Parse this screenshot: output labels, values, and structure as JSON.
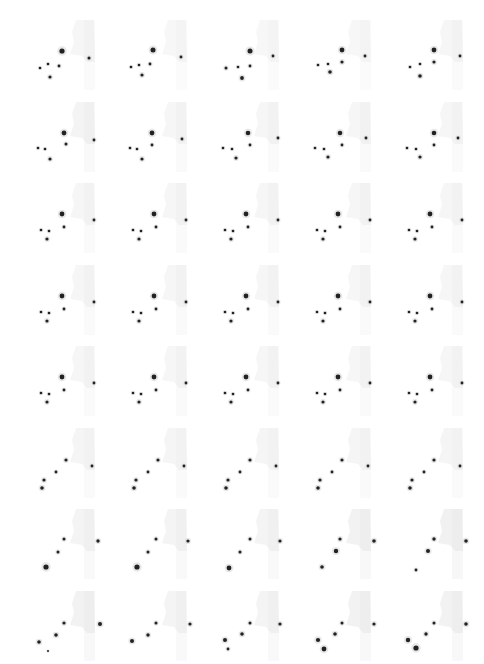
{
  "figure": {
    "layout": {
      "columns": 5,
      "rows": 8,
      "frame_count": 40
    },
    "background_color": "#ffffff",
    "tissue_color": "#e6e6e6",
    "cell_color": "#222222",
    "frames": [
      {
        "tissue": 0.35,
        "cells": [
          [
            48,
            37,
            2.6
          ],
          [
            75,
            44,
            1.5
          ],
          [
            34,
            50,
            1.3
          ],
          [
            45,
            52,
            1.4
          ],
          [
            26,
            54,
            1.3
          ],
          [
            36,
            63,
            1.6
          ]
        ]
      },
      {
        "tissue": 0.3,
        "cells": [
          [
            47,
            36,
            2.5
          ],
          [
            75,
            43,
            1.4
          ],
          [
            33,
            51,
            1.3
          ],
          [
            44,
            50,
            1.4
          ],
          [
            25,
            53,
            1.3
          ],
          [
            36,
            61,
            1.6
          ]
        ]
      },
      {
        "tissue": 0.3,
        "cells": [
          [
            52,
            37,
            2.5
          ],
          [
            75,
            42,
            1.4
          ],
          [
            40,
            53,
            1.3
          ],
          [
            52,
            52,
            1.4
          ],
          [
            28,
            54,
            1.5
          ],
          [
            44,
            64,
            1.9
          ]
        ]
      },
      {
        "tissue": 0.3,
        "cells": [
          [
            52,
            36,
            2.4
          ],
          [
            75,
            42,
            1.4
          ],
          [
            38,
            50,
            1.3
          ],
          [
            52,
            48,
            1.6
          ],
          [
            28,
            51,
            1.3
          ],
          [
            40,
            58,
            1.8
          ]
        ]
      },
      {
        "tissue": 0.35,
        "cells": [
          [
            52,
            36,
            2.4
          ],
          [
            78,
            42,
            1.4
          ],
          [
            38,
            50,
            1.3
          ],
          [
            52,
            48,
            1.6
          ],
          [
            28,
            53,
            1.3
          ],
          [
            38,
            62,
            1.8
          ]
        ]
      },
      {
        "tissue": 0.45,
        "cells": [
          [
            50,
            37,
            2.4
          ],
          [
            80,
            44,
            1.4
          ],
          [
            31,
            53,
            1.3
          ],
          [
            52,
            48,
            1.5
          ],
          [
            24,
            52,
            1.3
          ],
          [
            36,
            63,
            1.6
          ]
        ]
      },
      {
        "tissue": 0.35,
        "cells": [
          [
            46,
            37,
            2.4
          ],
          [
            76,
            43,
            1.4
          ],
          [
            31,
            53,
            1.3
          ],
          [
            46,
            49,
            1.4
          ],
          [
            24,
            52,
            1.3
          ],
          [
            36,
            63,
            1.6
          ]
        ]
      },
      {
        "tissue": 0.35,
        "cells": [
          [
            50,
            37,
            2.3
          ],
          [
            80,
            42,
            1.4
          ],
          [
            34,
            53,
            1.3
          ],
          [
            52,
            49,
            1.4
          ],
          [
            25,
            52,
            1.3
          ],
          [
            38,
            62,
            1.6
          ]
        ]
      },
      {
        "tissue": 0.35,
        "cells": [
          [
            50,
            37,
            2.3
          ],
          [
            76,
            42,
            1.4
          ],
          [
            34,
            53,
            1.3
          ],
          [
            52,
            49,
            1.4
          ],
          [
            25,
            52,
            1.3
          ],
          [
            38,
            61,
            1.6
          ]
        ]
      },
      {
        "tissue": 0.35,
        "cells": [
          [
            52,
            37,
            2.3
          ],
          [
            76,
            42,
            1.4
          ],
          [
            34,
            53,
            1.3
          ],
          [
            52,
            49,
            1.4
          ],
          [
            25,
            52,
            1.3
          ],
          [
            38,
            61,
            1.6
          ]
        ]
      },
      {
        "tissue": 0.35,
        "cells": [
          [
            48,
            37,
            2.4
          ],
          [
            80,
            43,
            1.4
          ],
          [
            35,
            54,
            1.3
          ],
          [
            50,
            50,
            1.4
          ],
          [
            27,
            53,
            1.3
          ],
          [
            33,
            62,
            1.6
          ]
        ]
      },
      {
        "tissue": 0.35,
        "cells": [
          [
            48,
            37,
            2.4
          ],
          [
            80,
            43,
            1.4
          ],
          [
            35,
            54,
            1.3
          ],
          [
            50,
            50,
            1.4
          ],
          [
            27,
            53,
            1.3
          ],
          [
            33,
            62,
            1.6
          ]
        ]
      },
      {
        "tissue": 0.35,
        "cells": [
          [
            48,
            37,
            2.4
          ],
          [
            80,
            43,
            1.4
          ],
          [
            35,
            54,
            1.3
          ],
          [
            50,
            50,
            1.4
          ],
          [
            27,
            53,
            1.3
          ],
          [
            33,
            62,
            1.6
          ]
        ]
      },
      {
        "tissue": 0.35,
        "cells": [
          [
            48,
            37,
            2.4
          ],
          [
            80,
            43,
            1.4
          ],
          [
            35,
            54,
            1.3
          ],
          [
            50,
            50,
            1.4
          ],
          [
            27,
            53,
            1.3
          ],
          [
            33,
            62,
            1.6
          ]
        ]
      },
      {
        "tissue": 0.35,
        "cells": [
          [
            48,
            37,
            2.4
          ],
          [
            80,
            43,
            1.4
          ],
          [
            35,
            54,
            1.3
          ],
          [
            50,
            50,
            1.4
          ],
          [
            27,
            53,
            1.3
          ],
          [
            33,
            62,
            1.6
          ]
        ]
      },
      {
        "tissue": 0.35,
        "cells": [
          [
            48,
            37,
            2.4
          ],
          [
            80,
            43,
            1.4
          ],
          [
            35,
            54,
            1.3
          ],
          [
            50,
            50,
            1.4
          ],
          [
            27,
            53,
            1.3
          ],
          [
            33,
            62,
            1.6
          ]
        ]
      },
      {
        "tissue": 0.35,
        "cells": [
          [
            48,
            37,
            2.4
          ],
          [
            80,
            43,
            1.4
          ],
          [
            35,
            54,
            1.3
          ],
          [
            50,
            50,
            1.4
          ],
          [
            27,
            53,
            1.3
          ],
          [
            33,
            62,
            1.6
          ]
        ]
      },
      {
        "tissue": 0.35,
        "cells": [
          [
            48,
            37,
            2.4
          ],
          [
            80,
            43,
            1.4
          ],
          [
            35,
            54,
            1.3
          ],
          [
            50,
            50,
            1.4
          ],
          [
            27,
            53,
            1.3
          ],
          [
            33,
            62,
            1.6
          ]
        ]
      },
      {
        "tissue": 0.35,
        "cells": [
          [
            48,
            37,
            2.4
          ],
          [
            80,
            43,
            1.4
          ],
          [
            35,
            54,
            1.3
          ],
          [
            50,
            50,
            1.4
          ],
          [
            27,
            53,
            1.3
          ],
          [
            33,
            62,
            1.6
          ]
        ]
      },
      {
        "tissue": 0.35,
        "cells": [
          [
            48,
            37,
            2.4
          ],
          [
            80,
            43,
            1.4
          ],
          [
            35,
            54,
            1.3
          ],
          [
            50,
            50,
            1.4
          ],
          [
            27,
            53,
            1.3
          ],
          [
            33,
            62,
            1.6
          ]
        ]
      },
      {
        "tissue": 0.35,
        "cells": [
          [
            48,
            37,
            2.4
          ],
          [
            80,
            43,
            1.4
          ],
          [
            35,
            54,
            1.3
          ],
          [
            50,
            50,
            1.4
          ],
          [
            27,
            53,
            1.3
          ],
          [
            33,
            62,
            1.6
          ]
        ]
      },
      {
        "tissue": 0.35,
        "cells": [
          [
            48,
            37,
            2.4
          ],
          [
            80,
            43,
            1.4
          ],
          [
            35,
            54,
            1.3
          ],
          [
            50,
            50,
            1.4
          ],
          [
            27,
            53,
            1.3
          ],
          [
            33,
            62,
            1.6
          ]
        ]
      },
      {
        "tissue": 0.35,
        "cells": [
          [
            48,
            37,
            2.4
          ],
          [
            80,
            43,
            1.4
          ],
          [
            35,
            54,
            1.3
          ],
          [
            50,
            50,
            1.4
          ],
          [
            27,
            53,
            1.3
          ],
          [
            33,
            62,
            1.6
          ]
        ]
      },
      {
        "tissue": 0.35,
        "cells": [
          [
            48,
            37,
            2.4
          ],
          [
            80,
            43,
            1.4
          ],
          [
            35,
            54,
            1.3
          ],
          [
            50,
            50,
            1.4
          ],
          [
            27,
            53,
            1.3
          ],
          [
            33,
            62,
            1.6
          ]
        ]
      },
      {
        "tissue": 0.35,
        "cells": [
          [
            48,
            37,
            2.4
          ],
          [
            80,
            43,
            1.4
          ],
          [
            35,
            54,
            1.3
          ],
          [
            50,
            50,
            1.4
          ],
          [
            27,
            53,
            1.3
          ],
          [
            33,
            62,
            1.6
          ]
        ]
      },
      {
        "tissue": 0.4,
        "cells": [
          [
            52,
            38,
            1.6
          ],
          [
            78,
            44,
            1.4
          ],
          [
            42,
            50,
            1.4
          ],
          [
            30,
            58,
            1.6
          ],
          [
            28,
            66,
            1.8
          ]
        ]
      },
      {
        "tissue": 0.4,
        "cells": [
          [
            52,
            38,
            1.6
          ],
          [
            78,
            44,
            1.4
          ],
          [
            42,
            50,
            1.4
          ],
          [
            30,
            58,
            1.6
          ],
          [
            28,
            66,
            1.8
          ]
        ]
      },
      {
        "tissue": 0.4,
        "cells": [
          [
            52,
            38,
            1.6
          ],
          [
            78,
            44,
            1.4
          ],
          [
            42,
            50,
            1.4
          ],
          [
            30,
            58,
            1.6
          ],
          [
            28,
            66,
            1.8
          ]
        ]
      },
      {
        "tissue": 0.4,
        "cells": [
          [
            52,
            38,
            1.6
          ],
          [
            78,
            44,
            1.4
          ],
          [
            42,
            50,
            1.4
          ],
          [
            30,
            58,
            1.6
          ],
          [
            28,
            66,
            1.8
          ]
        ]
      },
      {
        "tissue": 0.4,
        "cells": [
          [
            52,
            38,
            1.6
          ],
          [
            78,
            44,
            1.4
          ],
          [
            42,
            50,
            1.4
          ],
          [
            30,
            58,
            1.6
          ],
          [
            28,
            66,
            1.8
          ]
        ]
      },
      {
        "tissue": 0.45,
        "cells": [
          [
            50,
            36,
            1.5
          ],
          [
            84,
            38,
            1.7
          ],
          [
            44,
            49,
            1.5
          ],
          [
            32,
            64,
            2.6
          ]
        ]
      },
      {
        "tissue": 0.45,
        "cells": [
          [
            50,
            36,
            1.5
          ],
          [
            82,
            38,
            1.6
          ],
          [
            42,
            49,
            1.5
          ],
          [
            31,
            64,
            2.6
          ]
        ]
      },
      {
        "tissue": 0.45,
        "cells": [
          [
            52,
            36,
            1.5
          ],
          [
            82,
            38,
            1.6
          ],
          [
            42,
            49,
            1.5
          ],
          [
            31,
            65,
            2.4
          ]
        ]
      },
      {
        "tissue": 0.5,
        "cells": [
          [
            50,
            36,
            1.6
          ],
          [
            84,
            38,
            1.8
          ],
          [
            46,
            48,
            2.2
          ],
          [
            32,
            64,
            1.8
          ]
        ]
      },
      {
        "tissue": 0.55,
        "cells": [
          [
            52,
            36,
            1.7
          ],
          [
            84,
            38,
            1.8
          ],
          [
            46,
            48,
            2.0
          ],
          [
            34,
            67,
            1.4
          ]
        ]
      },
      {
        "tissue": 0.5,
        "cells": [
          [
            50,
            38,
            1.6
          ],
          [
            86,
            39,
            2.0
          ],
          [
            42,
            50,
            1.8
          ],
          [
            25,
            57,
            1.8
          ],
          [
            34,
            66,
            1.0
          ]
        ]
      },
      {
        "tissue": 0.45,
        "cells": [
          [
            50,
            38,
            1.5
          ],
          [
            84,
            39,
            1.6
          ],
          [
            42,
            50,
            1.7
          ],
          [
            26,
            56,
            2.0
          ]
        ]
      },
      {
        "tissue": 0.45,
        "cells": [
          [
            52,
            38,
            1.5
          ],
          [
            82,
            39,
            1.6
          ],
          [
            44,
            49,
            1.8
          ],
          [
            27,
            55,
            2.0
          ],
          [
            30,
            64,
            1.4
          ]
        ]
      },
      {
        "tissue": 0.5,
        "cells": [
          [
            52,
            38,
            1.5
          ],
          [
            84,
            39,
            1.6
          ],
          [
            45,
            49,
            1.8
          ],
          [
            28,
            55,
            2.1
          ],
          [
            34,
            64,
            2.4
          ]
        ]
      },
      {
        "tissue": 0.5,
        "cells": [
          [
            52,
            38,
            1.5
          ],
          [
            84,
            39,
            1.8
          ],
          [
            44,
            49,
            1.7
          ],
          [
            26,
            55,
            2.2
          ],
          [
            34,
            63,
            2.6
          ]
        ]
      }
    ]
  }
}
